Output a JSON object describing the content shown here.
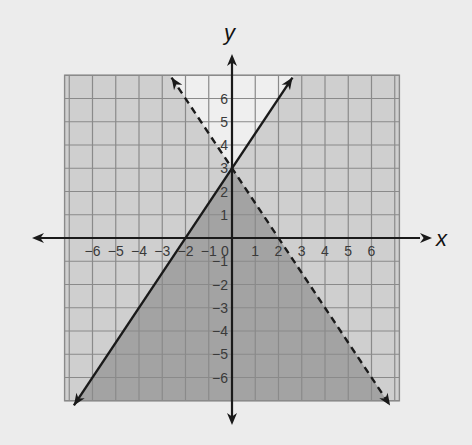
{
  "chart_data": {
    "type": "line",
    "title": "",
    "xlabel": "x",
    "ylabel": "y",
    "xlim": [
      -7.2,
      7.2
    ],
    "ylim": [
      -7,
      7
    ],
    "grid": true,
    "x_ticks": [
      -6,
      -5,
      -4,
      -3,
      -2,
      -1,
      0,
      1,
      2,
      3,
      4,
      5,
      6
    ],
    "y_ticks": [
      -6,
      -5,
      -4,
      -3,
      -2,
      -1,
      1,
      2,
      3,
      4,
      5,
      6
    ],
    "x_tick_labels": [
      "−6",
      "−5",
      "−4",
      "−3",
      "−2",
      "−1",
      "0",
      "1",
      "2",
      "3",
      "4",
      "5",
      "6"
    ],
    "y_tick_labels": [
      "−6",
      "−5",
      "−4",
      "−3",
      "−2",
      "−1",
      "1",
      "2",
      "3",
      "4",
      "5",
      "6"
    ],
    "series": [
      {
        "name": "boundary-solid",
        "equation": "y = 1.5x + 3",
        "slope": 1.5,
        "intercept": 3,
        "style": "solid",
        "x": [
          -6.8,
          2.6
        ],
        "y": [
          -7.2,
          6.9
        ]
      },
      {
        "name": "boundary-dashed",
        "equation": "y = -1.5x + 3",
        "slope": -1.5,
        "intercept": 3,
        "style": "dashed",
        "x": [
          -2.6,
          6.8
        ],
        "y": [
          6.9,
          -7.2
        ]
      }
    ],
    "regions": [
      {
        "name": "solution-region",
        "description": "y <= 1.5x + 3 and y < -1.5x + 3",
        "shade": "dark"
      },
      {
        "name": "single-inequality-region",
        "description": "satisfies exactly one inequality",
        "shade": "medium"
      },
      {
        "name": "unshaded-region",
        "description": "above both lines",
        "shade": "light"
      }
    ],
    "colors": {
      "background": "#ececec",
      "region_dark": "#a3a3a3",
      "region_medium": "#cfcfcf",
      "region_light": "#efefef",
      "grid": "#8a8a8a",
      "axis": "#1a1a1a",
      "line": "#1a1a1a"
    }
  }
}
